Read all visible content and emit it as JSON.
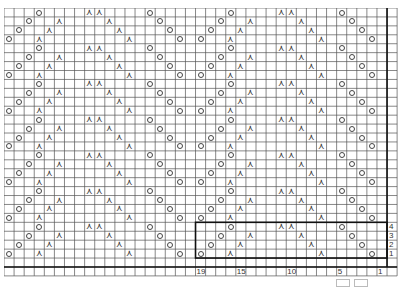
{
  "chart": {
    "cols": 38,
    "rows": 28,
    "cell_w": 10.08,
    "cell_h": 8.93,
    "repeat_cols": 19,
    "repeat_rows": 4,
    "grid_color": "#555555",
    "thick_color": "#111111",
    "repeat": [
      {
        "row": 1,
        "yo": [
          19,
          2
        ],
        "k2tog_left": [
          16
        ],
        "k2tog_right": [
          7
        ]
      },
      {
        "row": 2,
        "yo": [
          18,
          3
        ],
        "k2tog_left": [
          15
        ],
        "k2tog_right": [
          8
        ]
      },
      {
        "row": 3,
        "yo": [
          17,
          4
        ],
        "k2tog_left": [
          14
        ],
        "k2tog_right": [
          9
        ]
      },
      {
        "row": 4,
        "yo": [
          16,
          5
        ],
        "k2tog_left": [
          11
        ],
        "k2tog_right": [
          10
        ]
      }
    ],
    "repeat_box": {
      "col_from": 19,
      "col_to": 1,
      "row_from": 1,
      "row_to": 4
    },
    "row_labels": [
      "1",
      "2",
      "3",
      "4"
    ],
    "col_labels": [
      {
        "col": 19,
        "text": "19"
      },
      {
        "col": 15,
        "text": "15"
      },
      {
        "col": 10,
        "text": "10"
      },
      {
        "col": 5,
        "text": "5"
      },
      {
        "col": 1,
        "text": "1"
      }
    ]
  },
  "legend": {
    "items": [
      {
        "symbol": "knit-box",
        "text": ""
      },
      {
        "symbol": "purl-box",
        "text": ""
      }
    ]
  }
}
